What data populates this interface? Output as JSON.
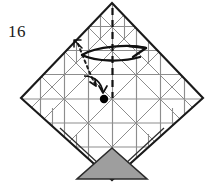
{
  "figure": {
    "step_number": "16",
    "type": "origami-crease-pattern-diagram"
  },
  "colors": {
    "outline": "#1a1a1a",
    "crease": "#808080",
    "crease_light": "#9a9a9a",
    "arrow": "#111111",
    "shaded_flap_fill": "#9e9e9e",
    "shaded_flap_stroke": "#2b2b2b",
    "dot": "#000000",
    "background": "#ffffff",
    "text": "#1a1a1a"
  },
  "geometry": {
    "apex_top": [
      112,
      3
    ],
    "vertex_left": [
      21,
      98
    ],
    "vertex_right": [
      203,
      98
    ],
    "vertex_bottom": [
      112,
      180
    ],
    "reference_dot": [
      104,
      99
    ],
    "dot_radius": 4.2
  },
  "annotations": {
    "fold_arrow_label": "fold-over-arrow",
    "valley_fold_label": "valley-fold-dashed-line",
    "reference_dot_label": "reference-point-dot",
    "shaded_flap_label": "shaded-triangular-flap",
    "guide_arrow_label": "small-guide-arrow",
    "dotted_guide_label": "dotted-guide-curve"
  }
}
